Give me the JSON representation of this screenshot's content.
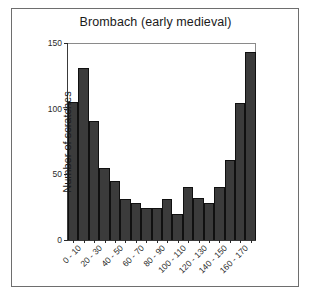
{
  "figure": {
    "background": "#ffffff",
    "frame_color": "#6e6e6e",
    "bar_fill": "#3b3b3b",
    "bar_edge": "#101010"
  },
  "chart_data": {
    "type": "bar",
    "title": "Brombach (early medieval)",
    "xlabel": "",
    "ylabel": "Number of scratches",
    "ylim": [
      0,
      150
    ],
    "yticks": [
      0,
      50,
      100,
      150
    ],
    "ytick_labels": [
      "0",
      "50",
      "100",
      "150"
    ],
    "grid": false,
    "legend": null,
    "categories": [
      "0 - 10",
      "10 - 20",
      "20 - 30",
      "30 - 40",
      "40 - 50",
      "50 - 60",
      "60 - 70",
      "70 - 80",
      "80 - 90",
      "90 - 100",
      "100 - 110",
      "110 - 120",
      "120 - 130",
      "130 - 140",
      "140 - 150",
      "150 - 160",
      "160 - 170",
      "170 - 180"
    ],
    "visible_tick_labels": [
      "0 - 10",
      "20 - 30",
      "40 - 50",
      "60 - 70",
      "80 - 90",
      "100 - 110",
      "120 - 130",
      "140 - 150",
      "160 - 170"
    ],
    "values": [
      105,
      131,
      91,
      55,
      45,
      31,
      28,
      24,
      24,
      31,
      20,
      40,
      32,
      28,
      40,
      61,
      104,
      143
    ]
  }
}
